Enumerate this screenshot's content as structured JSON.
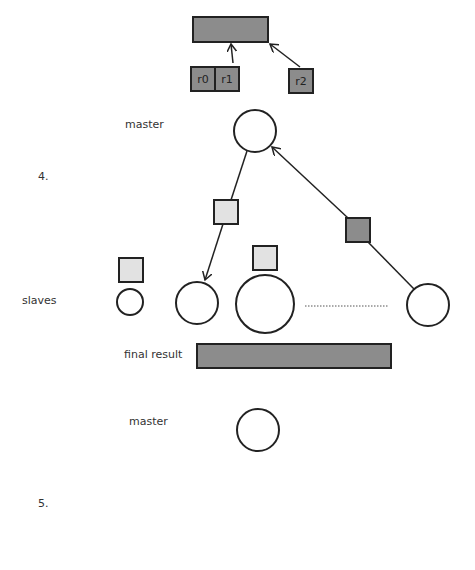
{
  "labels": {
    "master_top": "master",
    "step4": "4.",
    "slaves": "slaves",
    "final_result": "final result",
    "master_bottom": "master",
    "step5": "5."
  },
  "registers": [
    {
      "name": "r0"
    },
    {
      "name": "r1"
    },
    {
      "name": "r2"
    }
  ],
  "colors": {
    "dark_fill": "#8c8c8c",
    "light_fill": "#e2e2e2",
    "stroke": "#222222",
    "background": "#ffffff"
  },
  "slaves_dots": "............................"
}
